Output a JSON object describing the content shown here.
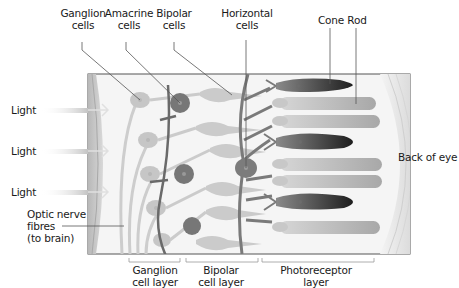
{
  "diagram": {
    "top_labels": {
      "ganglion": [
        "Ganglion",
        "cells"
      ],
      "amacrine": [
        "Amacrine",
        "cells"
      ],
      "bipolar": [
        "Bipolar",
        "cells"
      ],
      "horizontal": [
        "Horizontal",
        "cells"
      ],
      "cone": "Cone",
      "rod": "Rod"
    },
    "left_labels": {
      "light": [
        "Light",
        "Light",
        "Light"
      ],
      "optic_nerve": [
        "Optic nerve",
        "fibres",
        "(to brain)"
      ]
    },
    "right_label": "Back of eye",
    "bottom_labels": {
      "ganglion_layer": [
        "Ganglion",
        "cell layer"
      ],
      "bipolar_layer": [
        "Bipolar",
        "cell layer"
      ],
      "photoreceptor_layer": [
        "Photoreceptor",
        "layer"
      ]
    },
    "colors": {
      "light_cell": "#c8c8c8",
      "dark_cell": "#6e6e6e",
      "cone_dark": "#2a2a2a",
      "rod": "#b4b4b4",
      "background": "#f4f4f4",
      "border": "#555555"
    }
  }
}
